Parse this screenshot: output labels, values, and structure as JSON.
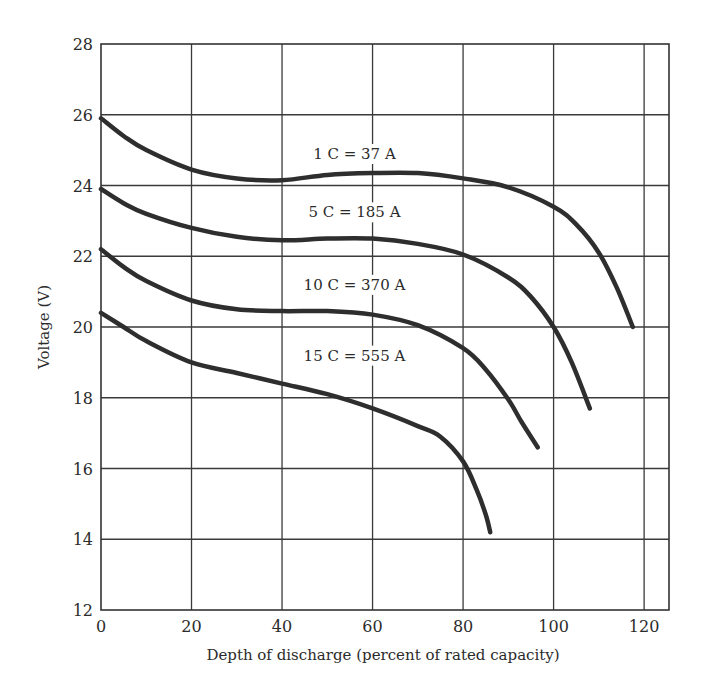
{
  "chart_data": {
    "type": "line",
    "title": "",
    "xlabel": "Depth of discharge (percent of rated capacity)",
    "ylabel": "Voltage (V)",
    "xlim": [
      0,
      125.5
    ],
    "ylim": [
      12,
      28
    ],
    "xticks": [
      0,
      20,
      40,
      60,
      80,
      100,
      120
    ],
    "yticks": [
      12,
      14,
      16,
      18,
      20,
      22,
      24,
      26,
      28
    ],
    "grid": true,
    "legend": "inline labels above each curve",
    "series": [
      {
        "name": "1 C = 37 A",
        "label_pos": [
          56,
          24.75
        ],
        "x": [
          0,
          5,
          10,
          20,
          30,
          40,
          50,
          60,
          70,
          80,
          90,
          100,
          105,
          110,
          114,
          117.5
        ],
        "y": [
          25.9,
          25.4,
          25.0,
          24.45,
          24.2,
          24.15,
          24.3,
          24.35,
          24.35,
          24.2,
          23.95,
          23.4,
          22.9,
          22.1,
          21.1,
          20.0
        ]
      },
      {
        "name": "5 C = 185 A",
        "label_pos": [
          56,
          23.1
        ],
        "x": [
          0,
          5,
          10,
          20,
          30,
          40,
          50,
          60,
          70,
          80,
          90,
          95,
          100,
          104,
          108
        ],
        "y": [
          23.9,
          23.5,
          23.2,
          22.8,
          22.55,
          22.45,
          22.5,
          22.5,
          22.35,
          22.05,
          21.4,
          20.85,
          20.0,
          19.0,
          17.7
        ]
      },
      {
        "name": "10 C = 370 A",
        "label_pos": [
          56,
          21.05
        ],
        "x": [
          0,
          5,
          10,
          20,
          30,
          40,
          50,
          60,
          70,
          80,
          85,
          90,
          93,
          96.5
        ],
        "y": [
          22.2,
          21.7,
          21.3,
          20.75,
          20.5,
          20.45,
          20.45,
          20.35,
          20.05,
          19.4,
          18.8,
          17.95,
          17.3,
          16.6
        ]
      },
      {
        "name": "15 C = 555 A",
        "label_pos": [
          56,
          19.05
        ],
        "x": [
          0,
          5,
          10,
          20,
          30,
          40,
          50,
          60,
          70,
          75,
          80,
          83,
          85,
          86
        ],
        "y": [
          20.4,
          20.0,
          19.6,
          19.0,
          18.7,
          18.4,
          18.1,
          17.7,
          17.2,
          16.9,
          16.2,
          15.4,
          14.7,
          14.2
        ]
      }
    ]
  }
}
